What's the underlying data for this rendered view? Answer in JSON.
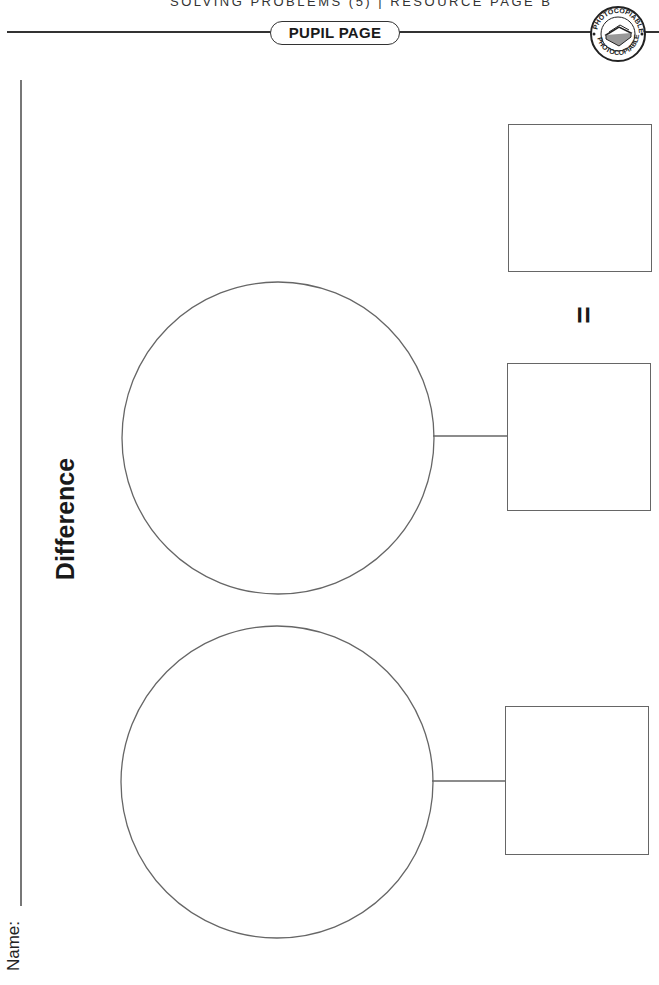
{
  "header": {
    "running_head": "SOLVING PROBLEMS (5)  |  RESOURCE PAGE B",
    "pill_label": "PUPIL PAGE",
    "badge_text_top": "PHOTOCOPIABLE",
    "badge_text_bottom": "PHOTOCOPIABLE"
  },
  "worksheet": {
    "title": "Difference",
    "name_label": "Name:",
    "equals_sign": "=",
    "rows": [
      {
        "circle": "empty",
        "box": "empty",
        "connector": true
      },
      {
        "circle": "empty",
        "box": "empty",
        "connector": true
      }
    ],
    "result_box": "empty"
  },
  "colors": {
    "line": "#666666",
    "text": "#1a1a1a",
    "background": "#ffffff"
  }
}
